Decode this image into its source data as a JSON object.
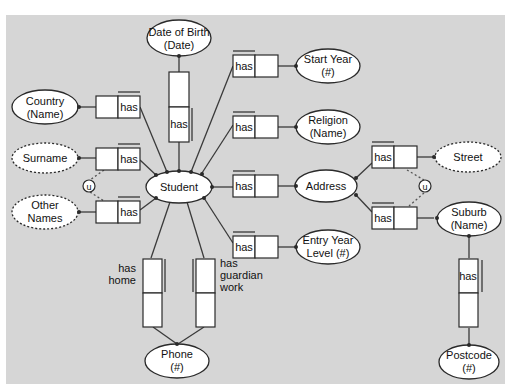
{
  "diagram": {
    "type": "ORM conceptual schema",
    "entities": {
      "student": "Student",
      "address": "Address",
      "phone_l1": "Phone",
      "phone_l2": "(#)",
      "dob_l1": "Date of Birth",
      "dob_l2": "(Date)",
      "country_l1": "Country",
      "country_l2": "(Name)",
      "start_year_l1": "Start Year",
      "start_year_l2": "(#)",
      "religion_l1": "Religion",
      "religion_l2": "(Name)",
      "entry_year_l1": "Entry Year",
      "entry_year_l2": "Level (#)",
      "suburb_l1": "Suburb",
      "suburb_l2": "(Name)",
      "postcode_l1": "Postcode",
      "postcode_l2": "(#)"
    },
    "value_types": {
      "surname": "Surname",
      "other_names_l1": "Other",
      "other_names_l2": "Names",
      "street": "Street"
    },
    "role_labels": {
      "has": "has",
      "has_home_l1": "has",
      "has_home_l2": "home",
      "has_guardian_l1": "has",
      "has_guardian_l2": "guardian",
      "has_guardian_l3": "work"
    },
    "constraints": {
      "union": "u"
    }
  }
}
